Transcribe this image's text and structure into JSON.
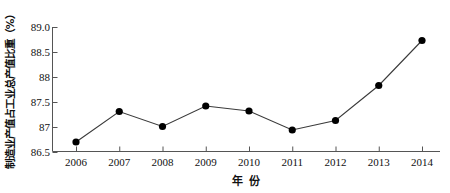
{
  "chart_data": {
    "type": "line",
    "title": "",
    "xlabel": "年 份",
    "ylabel": "制造业产值占工业总产值比重（%）",
    "categories": [
      "2006",
      "2007",
      "2008",
      "2009",
      "2010",
      "2011",
      "2012",
      "2013",
      "2014"
    ],
    "values": [
      86.7,
      87.31,
      87.01,
      87.42,
      87.32,
      86.94,
      87.13,
      87.83,
      88.73
    ],
    "series": [
      {
        "name": "制造业产值占工业总产值比重",
        "values": [
          86.7,
          87.31,
          87.01,
          87.42,
          87.32,
          86.94,
          87.13,
          87.83,
          88.73
        ]
      }
    ],
    "ylim": [
      86.5,
      89.0
    ],
    "xlim": [
      "2006",
      "2014"
    ],
    "ytick_labels": [
      "89.0",
      "88.5",
      "88",
      "87.5",
      "87",
      "86.5"
    ],
    "ytick_values": [
      89.0,
      88.5,
      88.0,
      87.5,
      87.0,
      86.5
    ],
    "xtick_labels": [
      "2006",
      "2007",
      "2008",
      "2009",
      "2010",
      "2011",
      "2012",
      "2013",
      "2014"
    ],
    "grid": false,
    "legend": false,
    "legend_position": "none",
    "marker": "filled-circle",
    "marker_color": "#000000",
    "line_color": "#3a3a3a",
    "axis_color": "#555555",
    "background_color": "#ffffff"
  },
  "axes": {
    "y_title": "制造业产值占工业总产值比重（%）",
    "x_title_part1": "年",
    "x_title_part2": "份"
  }
}
